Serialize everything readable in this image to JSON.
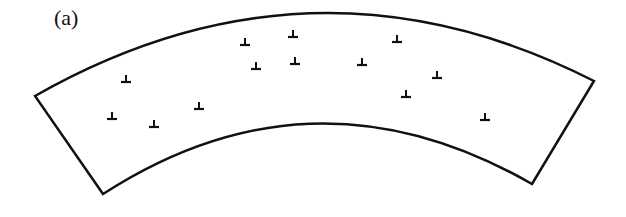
{
  "panel_label": "(a)",
  "colors": {
    "stroke": "#111111",
    "background": "#ffffff"
  },
  "shape": {
    "type": "curved-band",
    "outer_arc": {
      "start": [
        35,
        96
      ],
      "control": [
        313,
        -62
      ],
      "end": [
        594,
        81
      ]
    },
    "inner_arc": {
      "start": [
        103,
        194
      ],
      "control": [
        313,
        58
      ],
      "end": [
        532,
        184
      ]
    }
  },
  "dislocation_symbol": "⊥",
  "dislocations": [
    [
      126,
      80
    ],
    [
      112,
      117
    ],
    [
      154,
      125
    ],
    [
      199,
      107
    ],
    [
      245,
      43
    ],
    [
      293,
      35
    ],
    [
      256,
      67
    ],
    [
      295,
      62
    ],
    [
      397,
      40
    ],
    [
      362,
      63
    ],
    [
      437,
      76
    ],
    [
      406,
      95
    ],
    [
      485,
      118
    ]
  ]
}
